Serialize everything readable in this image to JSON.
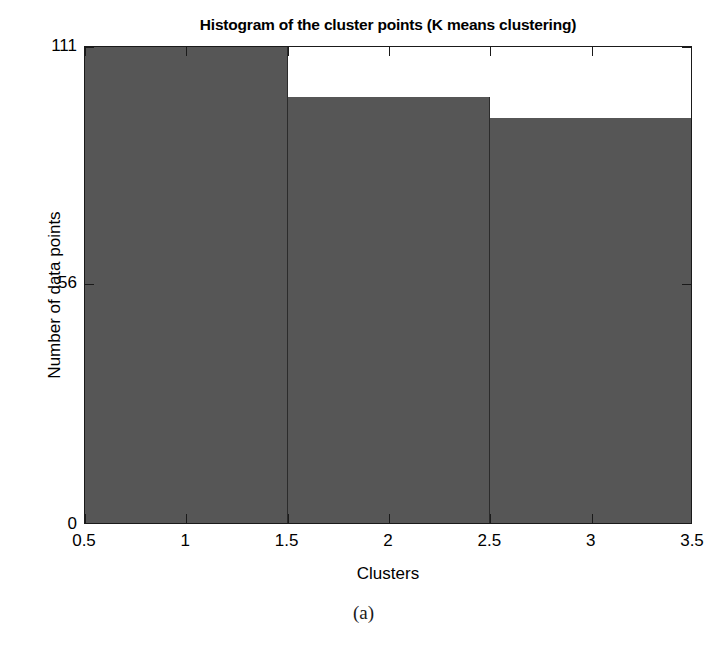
{
  "chart_data": {
    "type": "bar",
    "title": "Histogram of the cluster points (K means clustering)",
    "xlabel": "Clusters",
    "ylabel": "Number of data points",
    "categories": [
      "1",
      "2",
      "3"
    ],
    "values": [
      111,
      99,
      94
    ],
    "bin_edges": [
      0.5,
      1.5,
      2.5,
      3.5
    ],
    "xlim": [
      0.5,
      3.5
    ],
    "ylim": [
      0,
      111
    ],
    "xticks": [
      0.5,
      1,
      1.5,
      2,
      2.5,
      3,
      3.5
    ],
    "xticklabels": [
      "0.5",
      "1",
      "1.5",
      "2",
      "2.5",
      "3",
      "3.5"
    ],
    "yticks": [
      0,
      56,
      111
    ],
    "yticklabels": [
      "0",
      "56",
      "111"
    ],
    "grid": false,
    "legend": null,
    "bar_color": "#565656",
    "axis_color": "#1a1a1a"
  },
  "caption": {
    "text": "(a)"
  }
}
